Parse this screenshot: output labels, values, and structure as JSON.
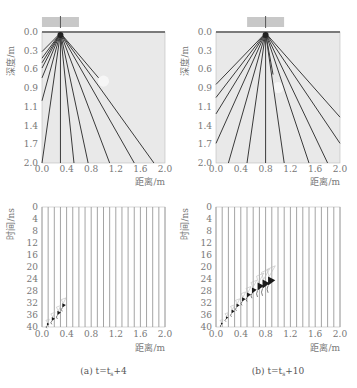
{
  "panels": [
    {
      "id": "a",
      "caption": "(a) t=t",
      "caption_sub": "s",
      "caption_tail": "+4",
      "source_x": 0.3,
      "top": {
        "ylabel": "深度/m",
        "xlabel": "距离/m",
        "yticks": [
          "0.0",
          "0.3",
          "0.6",
          "0.9",
          "1.1",
          "1.4",
          "1.7",
          "2.0"
        ],
        "xticks": [
          "0.0",
          "0.4",
          "0.8",
          "1.2",
          "1.6",
          "2.0"
        ],
        "ray_endpoints": [
          [
            0,
            0.3
          ],
          [
            0,
            0.4
          ],
          [
            0,
            0.47
          ],
          [
            0,
            0.55
          ],
          [
            0,
            0.7
          ],
          [
            0,
            1.05
          ],
          [
            0,
            2.0
          ],
          [
            0.3,
            2.0
          ],
          [
            0.52,
            2.0
          ],
          [
            0.75,
            2.0
          ],
          [
            1.1,
            2.0
          ],
          [
            1.5,
            2.0
          ],
          [
            1.82,
            2.0
          ],
          [
            0.92,
            0.7
          ]
        ],
        "anomaly": {
          "x": 1.0,
          "depth": 0.75,
          "r": 0.09
        }
      },
      "bottom": {
        "ylabel": "时间/ns",
        "xlabel": "距离/m",
        "yticks": [
          "0",
          "4",
          "8",
          "12",
          "16",
          "20",
          "24",
          "28",
          "32",
          "36",
          "40"
        ],
        "xticks": [
          "0.0",
          "0.4",
          "0.8",
          "1.2",
          "1.6",
          "2.0"
        ],
        "wavelets": [
          [
            0.08,
            39.2,
            0.6
          ],
          [
            0.16,
            37.5,
            0.8
          ],
          [
            0.25,
            35.5,
            0.9
          ],
          [
            0.33,
            33.0,
            0.9
          ]
        ]
      }
    },
    {
      "id": "b",
      "caption": "(b) t=t",
      "caption_sub": "s",
      "caption_tail": "+10",
      "source_x": 0.8,
      "top": {
        "ylabel": "深度/m",
        "xlabel": "距离/m",
        "yticks": [
          "0.0",
          "0.3",
          "0.6",
          "0.9",
          "1.1",
          "1.4",
          "1.7",
          "2.0"
        ],
        "xticks": [
          "0.0",
          "0.4",
          "0.8",
          "1.2",
          "1.6",
          "2.0"
        ],
        "ray_endpoints": [
          [
            0,
            0.8
          ],
          [
            0,
            1.0
          ],
          [
            0,
            1.25
          ],
          [
            0,
            1.7
          ],
          [
            0.2,
            2.0
          ],
          [
            0.5,
            2.0
          ],
          [
            0.8,
            2.0
          ],
          [
            1.1,
            2.0
          ],
          [
            1.5,
            2.0
          ],
          [
            1.8,
            2.0
          ],
          [
            2.0,
            1.7
          ],
          [
            2.0,
            1.3
          ],
          [
            0.92,
            0.65
          ]
        ],
        "anomaly": {
          "x": 1.0,
          "depth": 0.85,
          "r": 0.09
        }
      },
      "bottom": {
        "ylabel": "时间/ns",
        "xlabel": "距离/m",
        "yticks": [
          "0",
          "4",
          "8",
          "12",
          "16",
          "20",
          "24",
          "28",
          "32",
          "36",
          "40"
        ],
        "xticks": [
          "0.0",
          "0.4",
          "0.8",
          "1.2",
          "1.6",
          "2.0"
        ],
        "wavelets": [
          [
            0.08,
            39.0,
            0.5
          ],
          [
            0.16,
            37.0,
            0.6
          ],
          [
            0.25,
            35.0,
            0.8
          ],
          [
            0.33,
            33.0,
            0.8
          ],
          [
            0.42,
            31.0,
            0.9
          ],
          [
            0.5,
            29.5,
            1.0
          ],
          [
            0.58,
            28.0,
            1.2
          ],
          [
            0.67,
            26.8,
            1.6
          ],
          [
            0.75,
            26.0,
            1.8
          ],
          [
            0.84,
            25.0,
            1.8
          ]
        ]
      }
    }
  ],
  "colors": {
    "plot_bg": "#e9e9e9",
    "ray": "#3a3a3a",
    "trace": "#9a9a9a",
    "axis": "#888888",
    "text": "#777777",
    "antenna": "#c8c8c8",
    "wavelet": "#1a1a1a"
  }
}
